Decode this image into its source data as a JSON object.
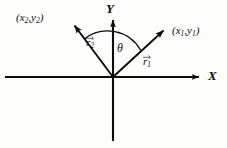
{
  "figure": {
    "type": "vector-diagram",
    "background_color": "#fdfdfc",
    "ink_color": "#0b0b0b"
  },
  "axes": {
    "x": {
      "label": "X",
      "arrow": "right",
      "start": [
        5,
        77
      ],
      "end": [
        205,
        77
      ]
    },
    "y": {
      "label": "Y",
      "arrow": "up",
      "start": [
        113,
        141
      ],
      "end": [
        113,
        14
      ]
    },
    "origin": [
      113,
      77
    ]
  },
  "vectors": [
    {
      "name": "r1",
      "label": "r",
      "subscript": "1",
      "label_overline": "arrow-right",
      "tip": [
        168,
        26
      ],
      "tail": [
        113,
        77
      ],
      "endpoint_label": {
        "open": "(",
        "x": "x",
        "x_sub": "1",
        "comma": ",",
        "y": "y",
        "y_sub": "1",
        "close": ")"
      }
    },
    {
      "name": "r2",
      "label": "r",
      "subscript": "2",
      "label_overline": "arrow-right",
      "tip": [
        70,
        21
      ],
      "tail": [
        113,
        77
      ],
      "endpoint_label": {
        "open": "(",
        "x": "x",
        "x_sub": "2",
        "comma": ",",
        "y": "y",
        "y_sub": "2",
        "close": ")"
      }
    }
  ],
  "angle": {
    "symbol": "θ",
    "name": "theta",
    "between": [
      "r2",
      "r1"
    ],
    "arc_radius": 38
  }
}
